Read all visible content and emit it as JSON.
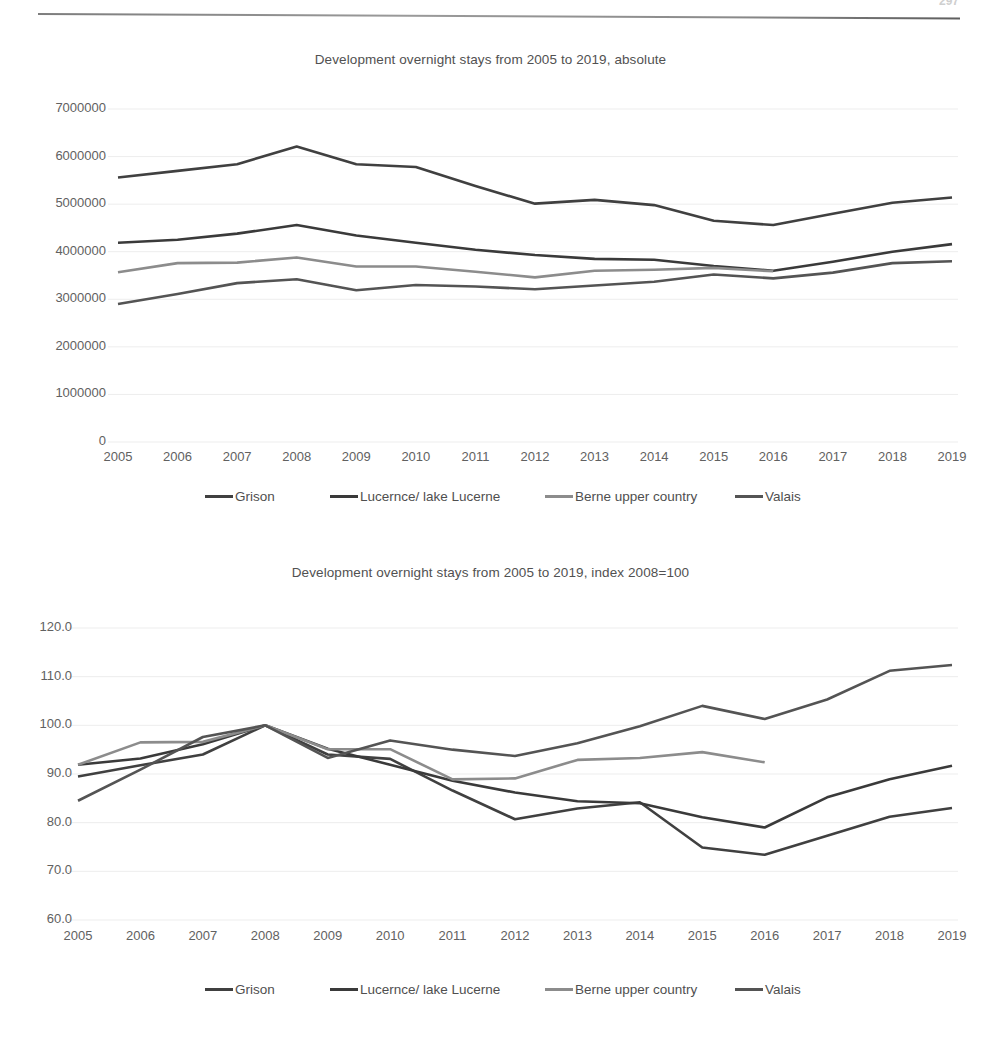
{
  "page": {
    "header_text": "",
    "page_number": "297"
  },
  "charts": [
    {
      "id": "chart-absolute",
      "title": "Development overnight stays from 2005 to 2019, absolute",
      "ylabels": [
        "7000000",
        "6000000",
        "5000000",
        "4000000",
        "3000000",
        "2000000",
        "1000000",
        "0"
      ]
    },
    {
      "id": "chart-index",
      "title": "Development overnight stays from 2005 to 2019, index 2008=100",
      "ylabels": [
        "120.0",
        "110.0",
        "100.0",
        "90.0",
        "80.0",
        "70.0",
        "60.0"
      ]
    }
  ],
  "legend": {
    "items": [
      {
        "label": "Grison",
        "color": "#404040"
      },
      {
        "label": "Lucernce/ lake Lucerne",
        "color": "#3a3a3a"
      },
      {
        "label": "Berne upper country",
        "color": "#8c8c8c"
      },
      {
        "label": "Valais",
        "color": "#545454"
      }
    ]
  },
  "chart_data": [
    {
      "type": "line",
      "title": "Development overnight stays from 2005 to 2019, absolute",
      "xlabel": "",
      "ylabel": "",
      "grid": true,
      "legend_position": "bottom",
      "categories": [
        "2005",
        "2006",
        "2007",
        "2008",
        "2009",
        "2010",
        "2011",
        "2012",
        "2013",
        "2014",
        "2015",
        "2016",
        "2017",
        "2018",
        "2019"
      ],
      "ylim": [
        0,
        7000000
      ],
      "ytick_values": [
        0,
        1000000,
        2000000,
        3000000,
        4000000,
        5000000,
        6000000,
        7000000
      ],
      "series": [
        {
          "name": "Grison",
          "color": "#404040",
          "values": [
            5560000,
            5700000,
            5840000,
            6210000,
            5840000,
            5780000,
            5380000,
            5010000,
            5090000,
            4980000,
            4650000,
            4560000,
            4800000,
            5030000,
            5140000
          ]
        },
        {
          "name": "Lucernce/ lake Lucerne",
          "color": "#3a3a3a",
          "values": [
            4190000,
            4250000,
            4380000,
            4560000,
            4340000,
            4190000,
            4040000,
            3930000,
            3850000,
            3830000,
            3700000,
            3600000,
            3790000,
            4000000,
            4160000
          ]
        },
        {
          "name": "Berne upper country",
          "color": "#8c8c8c",
          "values": [
            3570000,
            3760000,
            3770000,
            3880000,
            3690000,
            3690000,
            3580000,
            3460000,
            3600000,
            3620000,
            3660000,
            3590000,
            null,
            null,
            null
          ]
        },
        {
          "name": "Valais",
          "color": "#545454",
          "values": [
            2900000,
            3110000,
            3340000,
            3420000,
            3190000,
            3300000,
            3270000,
            3210000,
            3290000,
            3370000,
            3520000,
            3440000,
            3560000,
            3760000,
            3800000
          ]
        }
      ]
    },
    {
      "type": "line",
      "title": "Development overnight stays from 2005 to 2019, index 2008=100",
      "xlabel": "",
      "ylabel": "",
      "grid": true,
      "legend_position": "bottom",
      "categories": [
        "2005",
        "2006",
        "2007",
        "2008",
        "2009",
        "2010",
        "2011",
        "2012",
        "2013",
        "2014",
        "2015",
        "2016",
        "2017",
        "2018",
        "2019"
      ],
      "ylim": [
        60.0,
        120.0
      ],
      "ytick_values": [
        60.0,
        70.0,
        80.0,
        90.0,
        100.0,
        110.0,
        120.0
      ],
      "series": [
        {
          "name": "Grison",
          "color": "#404040",
          "values": [
            89.5,
            91.8,
            94.0,
            100.0,
            94.0,
            93.1,
            86.6,
            80.7,
            82.9,
            84.2,
            74.9,
            73.4,
            77.3,
            81.2,
            83.0
          ]
        },
        {
          "name": "Lucernce/ lake Lucerne",
          "color": "#3a3a3a",
          "values": [
            91.9,
            93.2,
            96.1,
            100.0,
            95.2,
            91.9,
            88.6,
            86.2,
            84.4,
            84.0,
            81.1,
            79.0,
            85.2,
            88.9,
            91.7
          ]
        },
        {
          "name": "Berne upper country",
          "color": "#8c8c8c",
          "values": [
            91.9,
            96.5,
            96.6,
            100.0,
            95.1,
            95.1,
            88.9,
            89.1,
            92.9,
            93.3,
            94.5,
            92.4,
            null,
            null,
            null
          ]
        },
        {
          "name": "Valais",
          "color": "#545454",
          "values": [
            84.5,
            90.9,
            97.6,
            100.0,
            93.3,
            96.9,
            95.0,
            93.7,
            96.3,
            99.8,
            104.0,
            101.3,
            105.3,
            111.2,
            112.4
          ]
        }
      ]
    }
  ]
}
